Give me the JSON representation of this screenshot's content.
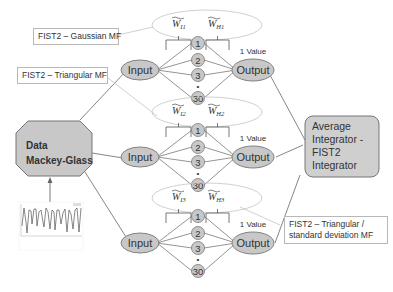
{
  "colors": {
    "node_fill": "#c8c8c8",
    "node_stroke": "#777777",
    "line": "#666666",
    "ellipse_stroke": "#c0c0c0",
    "integrator_fill": "#cfcfcf"
  },
  "data_node": {
    "line1": "Data",
    "line2": "Mackey-Glass"
  },
  "integrator": {
    "lines": [
      "Average",
      "Integrator -",
      "FIST2",
      "Integrator"
    ]
  },
  "mf_labels": [
    {
      "text": "FIST2 – Gaussian MF"
    },
    {
      "text": "FIST2 – Triangular MF"
    },
    {
      "text": "FIST2 – Triangular /",
      "text2": "standard deviation MF"
    }
  ],
  "networks": [
    {
      "input": "Input",
      "output": "Output",
      "output_note": "1 Value",
      "w_in": "W",
      "w_in_sub": "I1",
      "w_out": "W",
      "w_out_sub": "H1",
      "neurons": [
        "1",
        "2",
        "3",
        "30"
      ]
    },
    {
      "input": "Input",
      "output": "Output",
      "output_note": "1 Value",
      "w_in": "W",
      "w_in_sub": "I2",
      "w_out": "W",
      "w_out_sub": "H2",
      "neurons": [
        "1",
        "2",
        "3",
        "30"
      ]
    },
    {
      "input": "Input",
      "output": "Output",
      "output_note": "1 Value",
      "w_in": "W",
      "w_in_sub": "I3",
      "w_out": "W",
      "w_out_sub": "H3",
      "neurons": [
        "1",
        "2",
        "3",
        "30"
      ]
    }
  ],
  "ellipsis_dot": "•"
}
